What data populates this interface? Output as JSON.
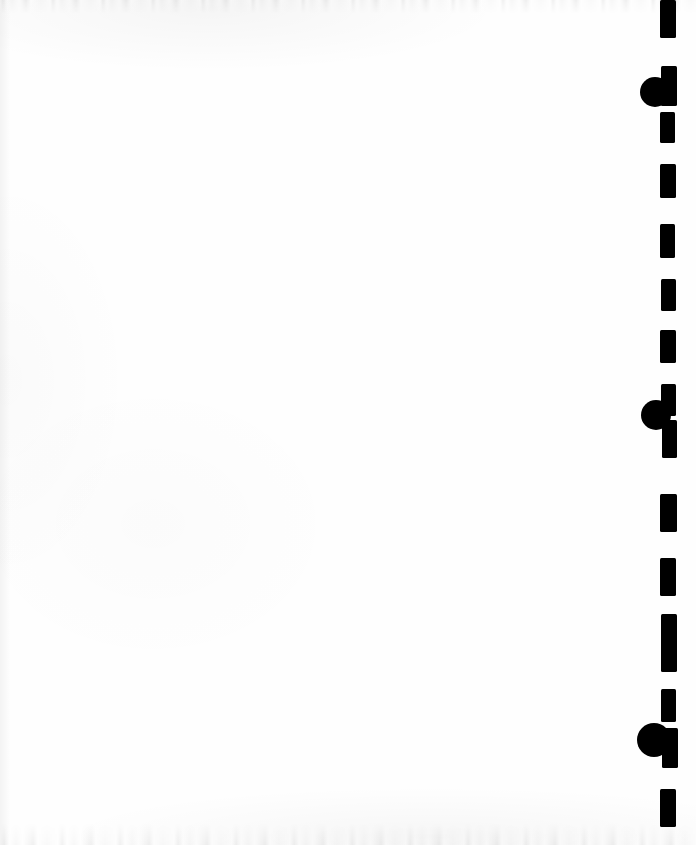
{
  "page": {
    "width": 696,
    "height": 845,
    "background_color": "#fefefe",
    "ink_color": "#000000",
    "body_text": "",
    "content_note": "No legible text, headings, captions or figures are present on the page; the sheet is blank apart from the right-hand dashed rule and three filled circular marks."
  },
  "marks": {
    "ink_color": "#000000",
    "dashed_rule": {
      "name": "dashed-vertical-rule",
      "orientation": "vertical",
      "x_left": 660,
      "x_right": 676,
      "stroke_width": 16,
      "dash_count": 16,
      "dashes": [
        {
          "y_top": 0,
          "y_bottom": 38,
          "x": 660,
          "width": 16
        },
        {
          "y_top": 66,
          "y_bottom": 106,
          "x": 661,
          "width": 16
        },
        {
          "y_top": 112,
          "y_bottom": 143,
          "x": 660,
          "width": 15
        },
        {
          "y_top": 164,
          "y_bottom": 198,
          "x": 660,
          "width": 16
        },
        {
          "y_top": 224,
          "y_bottom": 258,
          "x": 660,
          "width": 15
        },
        {
          "y_top": 279,
          "y_bottom": 311,
          "x": 661,
          "width": 15
        },
        {
          "y_top": 330,
          "y_bottom": 363,
          "x": 660,
          "width": 16
        },
        {
          "y_top": 384,
          "y_bottom": 416,
          "x": 661,
          "width": 15
        },
        {
          "y_top": 420,
          "y_bottom": 458,
          "x": 662,
          "width": 15
        },
        {
          "y_top": 494,
          "y_bottom": 532,
          "x": 660,
          "width": 17
        },
        {
          "y_top": 558,
          "y_bottom": 596,
          "x": 660,
          "width": 16
        },
        {
          "y_top": 614,
          "y_bottom": 651,
          "x": 661,
          "width": 16
        },
        {
          "y_top": 634,
          "y_bottom": 672,
          "x": 661,
          "width": 16
        },
        {
          "y_top": 689,
          "y_bottom": 722,
          "x": 661,
          "width": 15
        },
        {
          "y_top": 728,
          "y_bottom": 768,
          "x": 662,
          "width": 16
        },
        {
          "y_top": 789,
          "y_bottom": 827,
          "x": 660,
          "width": 16
        }
      ]
    },
    "circles": [
      {
        "name": "filled-circle-mark-1",
        "cx": 655,
        "cy": 92,
        "r": 15
      },
      {
        "name": "filled-circle-mark-2",
        "cx": 656,
        "cy": 415,
        "r": 15
      },
      {
        "name": "filled-circle-mark-3",
        "cx": 654,
        "cy": 740,
        "r": 17
      }
    ]
  }
}
